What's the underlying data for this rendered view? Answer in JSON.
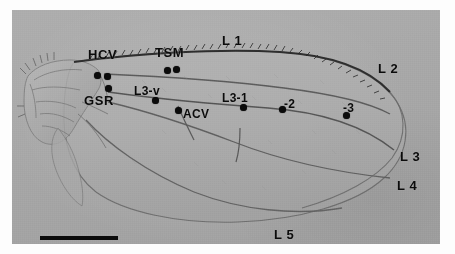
{
  "figure": {
    "caption_title": "Drosophila wing venation landmarks",
    "specimen": "fly wing micrograph",
    "background_color": "#a9a9a9",
    "ink_color": "#0b0b0b",
    "plate": {
      "x": 12,
      "y": 10,
      "width": 428,
      "height": 234
    }
  },
  "scale_bar": {
    "name": "scale-bar",
    "x": 28,
    "y": 226,
    "width": 78,
    "height": 4,
    "label": ""
  },
  "vein_labels": [
    {
      "id": "L1",
      "text": "L 1",
      "x": 210,
      "y": 24,
      "size": "normal"
    },
    {
      "id": "L2",
      "text": "L 2",
      "x": 366,
      "y": 52,
      "size": "normal"
    },
    {
      "id": "L3",
      "text": "L 3",
      "x": 388,
      "y": 140,
      "size": "normal"
    },
    {
      "id": "L4",
      "text": "L 4",
      "x": 385,
      "y": 169,
      "size": "normal"
    },
    {
      "id": "L5",
      "text": "L 5",
      "x": 262,
      "y": 218,
      "size": "normal"
    }
  ],
  "landmark_labels": [
    {
      "id": "HCV",
      "text": "HCV",
      "x": 76,
      "y": 38,
      "size": "normal"
    },
    {
      "id": "TSM",
      "text": "TSM",
      "x": 143,
      "y": 36,
      "size": "normal"
    },
    {
      "id": "GSR",
      "text": "GSR",
      "x": 72,
      "y": 84,
      "size": "normal"
    },
    {
      "id": "L3-v",
      "text": "L3-v",
      "x": 122,
      "y": 75,
      "size": "small"
    },
    {
      "id": "ACV",
      "text": "ACV",
      "x": 171,
      "y": 98,
      "size": "small"
    },
    {
      "id": "L3-1",
      "text": "L3-1",
      "x": 210,
      "y": 82,
      "size": "small"
    },
    {
      "id": "L3-2",
      "text": "-2",
      "x": 272,
      "y": 88,
      "size": "small"
    },
    {
      "id": "L3-3",
      "text": "-3",
      "x": 331,
      "y": 92,
      "size": "small"
    }
  ],
  "landmark_dots": [
    {
      "id": "dot-hcv-proximal",
      "for": "HCV",
      "x": 85,
      "y": 65
    },
    {
      "id": "dot-hcv-distal",
      "for": "HCV",
      "x": 95,
      "y": 66
    },
    {
      "id": "dot-gsr",
      "for": "GSR",
      "x": 96,
      "y": 78
    },
    {
      "id": "dot-tsm-anterior",
      "for": "TSM",
      "x": 155,
      "y": 60
    },
    {
      "id": "dot-tsm-posterior",
      "for": "TSM",
      "x": 164,
      "y": 59
    },
    {
      "id": "dot-l3-v",
      "for": "L3-v",
      "x": 143,
      "y": 90
    },
    {
      "id": "dot-acv",
      "for": "ACV",
      "x": 166,
      "y": 100
    },
    {
      "id": "dot-l3-1",
      "for": "L3-1",
      "x": 231,
      "y": 97
    },
    {
      "id": "dot-l3-2",
      "for": "L3-2",
      "x": 270,
      "y": 99
    },
    {
      "id": "dot-l3-3",
      "for": "L3-3",
      "x": 334,
      "y": 105
    }
  ]
}
